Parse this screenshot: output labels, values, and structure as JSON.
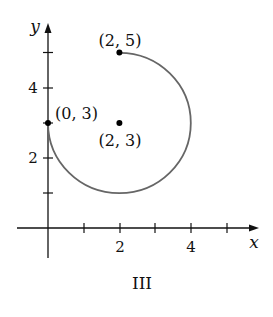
{
  "figure": {
    "caption": "III",
    "axes": {
      "x_label": "x",
      "y_label": "y",
      "x_ticks": [
        1,
        2,
        3,
        4,
        5
      ],
      "x_tick_labels": [
        "2",
        "4"
      ],
      "y_ticks": [
        1,
        2,
        3,
        4,
        5
      ],
      "y_tick_labels": [
        "2",
        "4"
      ]
    },
    "points": [
      {
        "label": "(2, 5)",
        "x": 2,
        "y": 5
      },
      {
        "label": "(0, 3)",
        "x": 0,
        "y": 3
      },
      {
        "label": "(2, 3)",
        "x": 2,
        "y": 3
      }
    ],
    "curve": {
      "type": "circular arc",
      "center": [
        2,
        3
      ],
      "radius": 2,
      "start": [
        0,
        3
      ],
      "end": [
        2,
        5
      ],
      "sweep": "three-quarter circle passing through (2, 1) and (4, 3)",
      "color": "#666666"
    },
    "colors": {
      "axis": "#111111",
      "curve": "#666666",
      "point": "#000000"
    }
  }
}
